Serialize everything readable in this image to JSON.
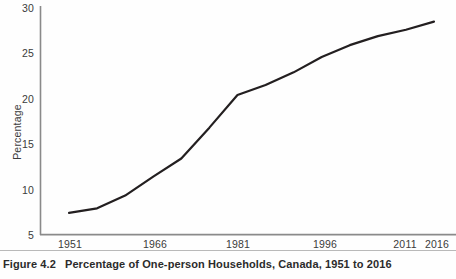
{
  "figure": {
    "number_label": "Figure 4.2",
    "caption_title": "Percentage of One-person Households, Canada, 1951 to 2016"
  },
  "chart_data": {
    "type": "line",
    "title": "Percentage of One-person Households, Canada, 1951 to 2016",
    "xlabel": "",
    "ylabel": "Percentage",
    "xlim": [
      1951,
      2016
    ],
    "ylim": [
      5,
      30
    ],
    "grid": false,
    "legend": null,
    "xticks": [
      "1951",
      "1966",
      "1981",
      "1996",
      "2011",
      "2016"
    ],
    "xtick_values": [
      1951,
      1966,
      1981,
      1996,
      2011,
      2016
    ],
    "yticks": [
      "5",
      "10",
      "15",
      "20",
      "25",
      "30"
    ],
    "ytick_values": [
      5,
      10,
      15,
      20,
      25,
      30
    ],
    "line_color": "#231f20",
    "series": [
      {
        "name": "One-person households",
        "x": [
          1951,
          1956,
          1961,
          1966,
          1971,
          1976,
          1981,
          1986,
          1991,
          1996,
          2001,
          2006,
          2011,
          2016
        ],
        "values": [
          7.4,
          7.9,
          9.3,
          11.4,
          13.4,
          16.8,
          20.4,
          21.5,
          22.9,
          24.6,
          25.9,
          26.9,
          27.6,
          28.5
        ]
      }
    ]
  }
}
